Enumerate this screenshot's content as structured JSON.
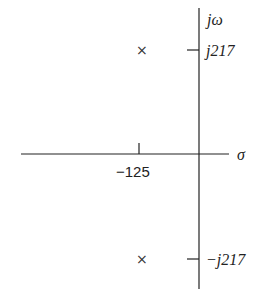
{
  "diagram": {
    "type": "s-plane pole plot",
    "axes": {
      "real_label": "σ",
      "imag_label": "jω"
    },
    "ticks": {
      "real": "−125",
      "imag_pos": "j217",
      "imag_neg": "−j217"
    },
    "poles": [
      {
        "marker": "×",
        "real": -125,
        "imag": 217
      },
      {
        "marker": "×",
        "real": -125,
        "imag": -217
      }
    ]
  }
}
